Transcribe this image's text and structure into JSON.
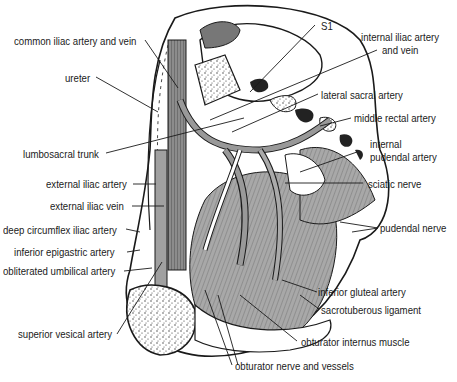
{
  "diagram": {
    "colors": {
      "line": "#1a1a1a",
      "muscle": "#a9a9a9",
      "vessel": "#9a9a9a",
      "bone": "#ffffff",
      "dark": "#3a3a3a"
    },
    "labels_left": [
      {
        "id": "common-iliac",
        "text": "common iliac artery and vein"
      },
      {
        "id": "ureter",
        "text": "ureter"
      },
      {
        "id": "lumbosacral-trunk",
        "text": "lumbosacral trunk"
      },
      {
        "id": "external-iliac-artery",
        "text": "external iliac artery"
      },
      {
        "id": "external-iliac-vein",
        "text": "external iliac vein"
      },
      {
        "id": "deep-circumflex-iliac",
        "text": "deep circumflex iliac artery"
      },
      {
        "id": "inferior-epigastric",
        "text": "inferior epigastric artery"
      },
      {
        "id": "obliterated-umbilical",
        "text": "obliterated umbilical artery"
      },
      {
        "id": "superior-vesical",
        "text": "superior vesical artery"
      }
    ],
    "labels_right": [
      {
        "id": "s1",
        "text": "S1"
      },
      {
        "id": "internal-iliac-1",
        "text": "internal iliac artery"
      },
      {
        "id": "internal-iliac-2",
        "text": "and vein"
      },
      {
        "id": "lateral-sacral",
        "text": "lateral sacral artery"
      },
      {
        "id": "middle-rectal",
        "text": "middle rectal artery"
      },
      {
        "id": "internal-pudendal-1",
        "text": "internal"
      },
      {
        "id": "internal-pudendal-2",
        "text": "pudendal artery"
      },
      {
        "id": "sciatic",
        "text": "sciatic nerve"
      },
      {
        "id": "pudendal-nerve",
        "text": "pudendal nerve"
      },
      {
        "id": "inferior-gluteal",
        "text": "inferior gluteal artery"
      },
      {
        "id": "sacrotuberous",
        "text": "sacrotuberous ligament"
      },
      {
        "id": "obturator-internus",
        "text": "obturator internus muscle"
      },
      {
        "id": "obturator-nerve",
        "text": "obturator nerve and vessels"
      }
    ]
  }
}
